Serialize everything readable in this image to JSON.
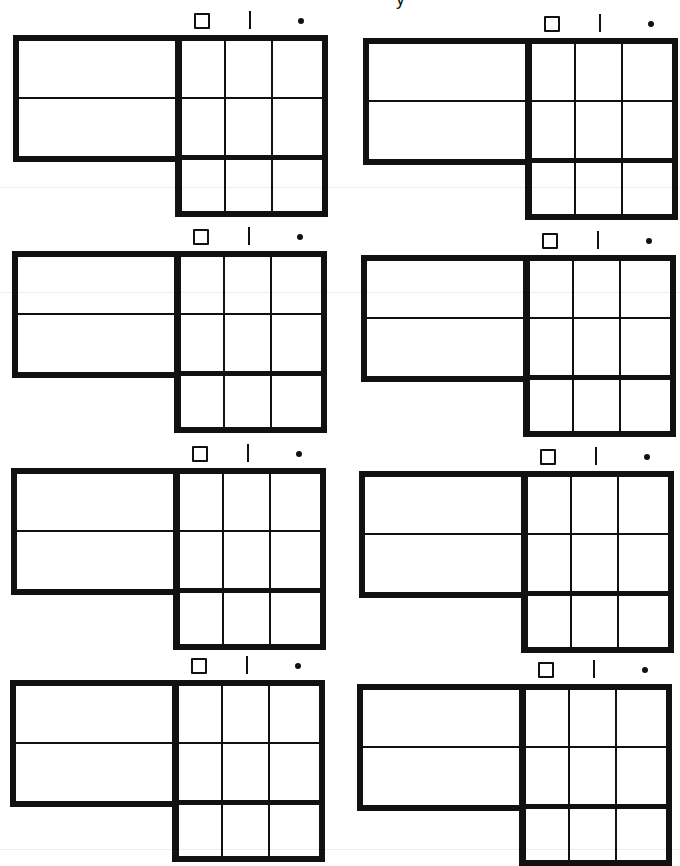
{
  "page": {
    "background": "#ffffff",
    "ink_color": "#111111",
    "top_partial_glyph": "y"
  },
  "column_headers": [
    {
      "name": "square",
      "glyph": "□"
    },
    {
      "name": "bar",
      "glyph": "|"
    },
    {
      "name": "dot",
      "glyph": "•"
    }
  ],
  "blocks": [
    {
      "id": 1,
      "row": 1,
      "col": "left",
      "x": 13,
      "y": 35,
      "left_rows": 2,
      "grid_rows": 3,
      "grid_cols": 3
    },
    {
      "id": 2,
      "row": 1,
      "col": "right",
      "x": 363,
      "y": 38,
      "left_rows": 2,
      "grid_rows": 3,
      "grid_cols": 3
    },
    {
      "id": 3,
      "row": 2,
      "col": "left",
      "x": 12,
      "y": 251,
      "left_rows": 2,
      "grid_rows": 3,
      "grid_cols": 3
    },
    {
      "id": 4,
      "row": 2,
      "col": "right",
      "x": 361,
      "y": 255,
      "left_rows": 2,
      "grid_rows": 3,
      "grid_cols": 3
    },
    {
      "id": 5,
      "row": 3,
      "col": "left",
      "x": 11,
      "y": 468,
      "left_rows": 2,
      "grid_rows": 3,
      "grid_cols": 3
    },
    {
      "id": 6,
      "row": 3,
      "col": "right",
      "x": 359,
      "y": 471,
      "left_rows": 2,
      "grid_rows": 3,
      "grid_cols": 3
    },
    {
      "id": 7,
      "row": 4,
      "col": "left",
      "x": 10,
      "y": 680,
      "left_rows": 2,
      "grid_rows": 3,
      "grid_cols": 3
    },
    {
      "id": 8,
      "row": 4,
      "col": "right",
      "x": 357,
      "y": 684,
      "left_rows": 2,
      "grid_rows": 3,
      "grid_cols": 3
    }
  ]
}
